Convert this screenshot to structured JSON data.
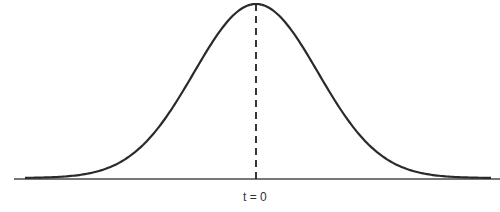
{
  "figure": {
    "type": "gaussian-curve",
    "center_label": "t = 0",
    "colors": {
      "curve": "#2a2a2a",
      "axis": "#777777",
      "center_line": "#222222",
      "background": "#ffffff"
    }
  },
  "chart_data": {
    "type": "line",
    "title": "",
    "xlabel": "",
    "ylabel": "",
    "annotations": [
      "t = 0"
    ],
    "series": [
      {
        "name": "gaussian",
        "description": "bell-shaped curve symmetric about t = 0, with dashed vertical line at peak"
      }
    ],
    "grid": false
  }
}
